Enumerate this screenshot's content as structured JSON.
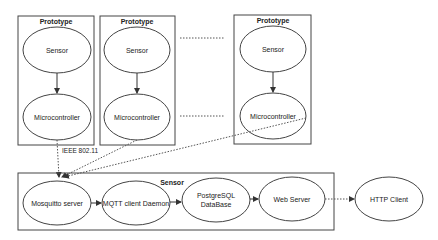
{
  "diagram": {
    "prototypes": [
      {
        "title": "Prototype",
        "nodes": [
          "Sensor",
          "Microcontroller"
        ]
      },
      {
        "title": "Prototype",
        "nodes": [
          "Sensor",
          "Microcontroller"
        ]
      },
      {
        "title": "Prototype",
        "nodes": [
          "Sensor",
          "Microcontroller"
        ]
      }
    ],
    "server_group": {
      "title": "Sensor",
      "nodes": [
        "Mosquitto server",
        "MQTT client Daemon",
        "PostgreSQL DataBase",
        "Web Server"
      ]
    },
    "external_node": "HTTP Client",
    "edge_label": "IEEE 802.11",
    "colors": {
      "stroke": "#333333",
      "background": "#ffffff"
    }
  }
}
